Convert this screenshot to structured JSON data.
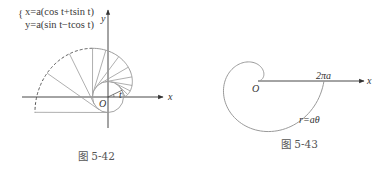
{
  "figures": [
    {
      "id": "fig-5-42",
      "caption": "图 5-42",
      "equations": {
        "line1": "x=a(cos t+tsin t)",
        "line2": "y=a(sin t−tcos t)"
      },
      "labels": {
        "x_axis": "x",
        "y_axis": "y",
        "origin": "O",
        "angle": "t"
      },
      "curve": "involute of circle",
      "solid_range_t": [
        0,
        3.1416
      ],
      "dashed_range_t": [
        3.1416,
        4.7124
      ]
    },
    {
      "id": "fig-5-43",
      "caption": "图 5-43",
      "labels": {
        "x_axis": "x",
        "origin": "O",
        "intercept": "2πa",
        "curve_equation": "r=aθ"
      },
      "curve": "Archimedean spiral",
      "theta_range": [
        0,
        6.2832
      ]
    }
  ],
  "colors": {
    "axis": "#333333",
    "curve": "#9a9a9a",
    "text": "#333333"
  }
}
